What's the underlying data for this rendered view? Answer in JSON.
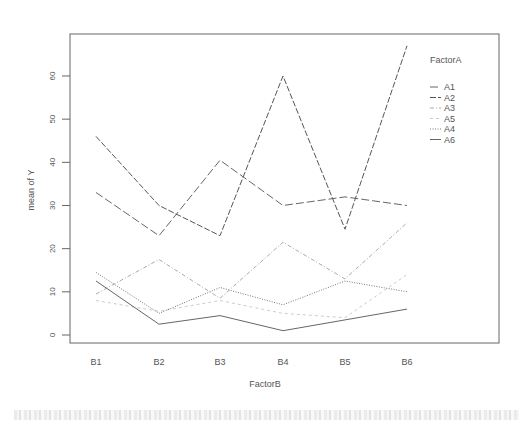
{
  "chart_data": {
    "type": "line",
    "title": "",
    "xlabel": "FactorB",
    "ylabel": "mean of  Y",
    "categories": [
      "B1",
      "B2",
      "B3",
      "B4",
      "B5",
      "B6"
    ],
    "ylim": [
      -2,
      69
    ],
    "yticks": [
      0,
      10,
      20,
      30,
      40,
      50,
      60
    ],
    "grid": false,
    "legend": {
      "title": "FactorA",
      "position": "top-right-inside"
    },
    "series": [
      {
        "name": "A1",
        "values": [
          33,
          23,
          40.5,
          30,
          32,
          30
        ],
        "dash": "8,3",
        "color": "#666666"
      },
      {
        "name": "A2",
        "values": [
          46,
          30,
          23,
          60,
          24.5,
          67
        ],
        "dash": "6,2",
        "color": "#555555"
      },
      {
        "name": "A3",
        "values": [
          9.5,
          17.5,
          8.5,
          21.5,
          13,
          26
        ],
        "dash": "4,2,1,2",
        "color": "#aaaaaa"
      },
      {
        "name": "A5",
        "values": [
          8,
          5.5,
          8,
          5,
          4,
          14
        ],
        "dash": "3,3",
        "color": "#cccccc"
      },
      {
        "name": "A4",
        "values": [
          14.5,
          5,
          11,
          7,
          12.5,
          10
        ],
        "dash": "1,1.5",
        "color": "#777777"
      },
      {
        "name": "A6",
        "values": [
          12.5,
          2.5,
          4.5,
          1,
          3.5,
          6
        ],
        "dash": "",
        "color": "#666666"
      }
    ]
  },
  "labels": {
    "xlabel": "FactorB",
    "ylabel": "mean of  Y",
    "legend_title": "FactorA"
  }
}
